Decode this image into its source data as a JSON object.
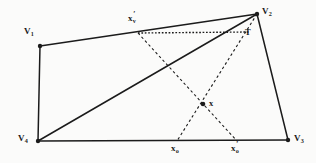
{
  "figure": {
    "type": "geometry-diagram",
    "background_color": "#fbfbfa",
    "stroke_color": "#1b1b1b",
    "width": 316,
    "height": 163,
    "points": [
      {
        "id": "V1",
        "label": "V",
        "sub": "1",
        "prime": false,
        "x": 40,
        "y": 46,
        "dot": true,
        "label_x": 24,
        "label_y": 27
      },
      {
        "id": "V2",
        "label": "V",
        "sub": "2",
        "prime": false,
        "x": 257,
        "y": 14,
        "dot": true,
        "label_x": 262,
        "label_y": 7
      },
      {
        "id": "V3",
        "label": "V",
        "sub": "3",
        "prime": false,
        "x": 288,
        "y": 140,
        "dot": true,
        "label_x": 294,
        "label_y": 134
      },
      {
        "id": "V4",
        "label": "V",
        "sub": "4",
        "prime": false,
        "x": 38,
        "y": 141,
        "dot": true,
        "label_x": 19,
        "label_y": 134
      },
      {
        "id": "xvp",
        "label": "x",
        "sub": "v",
        "prime": true,
        "x": 138,
        "y": 33,
        "dot": false,
        "label_x": 128,
        "label_y": 14
      },
      {
        "id": "T",
        "label": "T",
        "sub": "",
        "prime": false,
        "x": 242,
        "y": 32,
        "dot": false,
        "label_x": 244,
        "label_y": 27
      },
      {
        "id": "x",
        "label": "x",
        "sub": "",
        "prime": false,
        "x": 203,
        "y": 104,
        "dot": true,
        "label_x": 209,
        "label_y": 99
      },
      {
        "id": "xo",
        "label": "x",
        "sub": "o",
        "prime": false,
        "x": 177,
        "y": 141,
        "dot": false,
        "label_x": 171,
        "label_y": 144
      },
      {
        "id": "xop",
        "label": "x",
        "sub": "o",
        "prime": true,
        "x": 237,
        "y": 141,
        "dot": false,
        "label_x": 231,
        "label_y": 144
      }
    ],
    "solid_edges": [
      {
        "name": "edge-v1-v2",
        "x1": 40,
        "y1": 46,
        "x2": 257,
        "y2": 14
      },
      {
        "name": "edge-v2-v3",
        "x1": 257,
        "y1": 14,
        "x2": 288,
        "y2": 140
      },
      {
        "name": "edge-v3-v4",
        "x1": 288,
        "y1": 140,
        "x2": 38,
        "y2": 141
      },
      {
        "name": "edge-v4-v1",
        "x1": 38,
        "y1": 141,
        "x2": 40,
        "y2": 46
      },
      {
        "name": "diagonal-v4-v2",
        "x1": 38,
        "y1": 141,
        "x2": 257,
        "y2": 14
      }
    ],
    "dotted_edges": [
      {
        "name": "chord-xvprime-to-T",
        "x1": 138,
        "y1": 33,
        "x2": 249,
        "y2": 32
      }
    ],
    "dashed_edges": [
      {
        "name": "cevian-xvprime-to-xoprime",
        "x1": 138,
        "y1": 33,
        "x2": 237,
        "y2": 141
      },
      {
        "name": "cevian-v2-to-xo",
        "x1": 257,
        "y1": 14,
        "x2": 177,
        "y2": 141
      }
    ]
  },
  "labels": {
    "v1": "V",
    "v1_sub": "1",
    "v2": "V",
    "v2_sub": "2",
    "v3": "V",
    "v3_sub": "3",
    "v4": "V",
    "v4_sub": "4",
    "xvprime": "x",
    "xvprime_sub": "v",
    "xvprime_mark": "′",
    "t": "T",
    "x": "x",
    "xo": "x",
    "xo_sub": "o",
    "xoprime": "x",
    "xoprime_sub": "o",
    "xoprime_mark": "′"
  }
}
